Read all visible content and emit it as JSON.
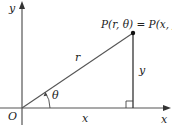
{
  "diagram": {
    "labels": {
      "y_axis": "y",
      "x_axis": "x",
      "origin": "O",
      "point": "P(r, θ) = P(x, y)",
      "radius": "r",
      "angle": "θ",
      "vertical_leg": "y",
      "horizontal_leg": "x"
    },
    "colors": {
      "axis": "#555555",
      "line": "#333333",
      "point": "#111111",
      "text": "#222222"
    }
  }
}
